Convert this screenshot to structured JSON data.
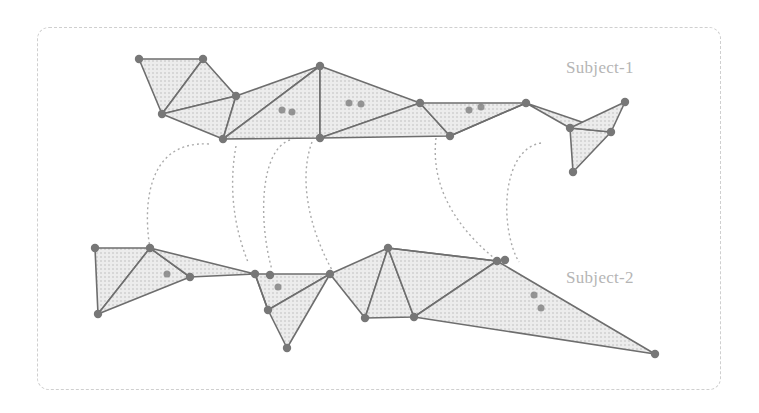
{
  "labels": {
    "subject1": "Subject-1",
    "subject2": "Subject-2"
  },
  "colors": {
    "edge": "#6e6e6e",
    "node": "#777777",
    "fill": "#d9d9d9",
    "connector": "#aaaaaa",
    "frame": "#cfcfcf",
    "label": "#b5b5b5"
  },
  "subject1": {
    "nodes": [
      [
        139,
        59
      ],
      [
        203,
        59
      ],
      [
        162,
        114
      ],
      [
        236,
        96
      ],
      [
        223,
        139
      ],
      [
        320,
        66
      ],
      [
        320,
        138
      ],
      [
        420,
        103
      ],
      [
        450,
        136
      ],
      [
        526,
        103
      ],
      [
        570,
        128
      ],
      [
        625,
        102
      ],
      [
        611,
        132
      ],
      [
        573,
        172
      ]
    ],
    "triangles": [
      [
        0,
        1,
        2
      ],
      [
        1,
        2,
        3
      ],
      [
        2,
        3,
        4
      ],
      [
        3,
        4,
        5
      ],
      [
        4,
        5,
        6
      ],
      [
        5,
        6,
        7
      ],
      [
        6,
        7,
        8
      ],
      [
        7,
        8,
        9
      ],
      [
        8,
        9,
        9
      ],
      [
        9,
        10,
        12
      ],
      [
        10,
        12,
        13
      ],
      [
        10,
        11,
        12
      ]
    ],
    "features": [
      [
        282,
        110
      ],
      [
        292,
        112
      ],
      [
        349,
        103
      ],
      [
        361,
        104
      ],
      [
        469,
        110
      ],
      [
        481,
        107
      ]
    ]
  },
  "subject2": {
    "nodes": [
      [
        95,
        248
      ],
      [
        150,
        248
      ],
      [
        190,
        277
      ],
      [
        98,
        314
      ],
      [
        255,
        274
      ],
      [
        270,
        275
      ],
      [
        330,
        274
      ],
      [
        268,
        310
      ],
      [
        287,
        348
      ],
      [
        365,
        318
      ],
      [
        388,
        248
      ],
      [
        414,
        317
      ],
      [
        497,
        261
      ],
      [
        505,
        260
      ],
      [
        655,
        354
      ]
    ],
    "triangles": [
      [
        0,
        1,
        3
      ],
      [
        1,
        2,
        3
      ],
      [
        1,
        2,
        4
      ],
      [
        4,
        6,
        7
      ],
      [
        6,
        7,
        8
      ],
      [
        4,
        7,
        7
      ],
      [
        6,
        9,
        10
      ],
      [
        9,
        10,
        11
      ],
      [
        10,
        11,
        12
      ],
      [
        11,
        12,
        14
      ],
      [
        10,
        12,
        12
      ]
    ],
    "features": [
      [
        167,
        274
      ],
      [
        278,
        287
      ],
      [
        534,
        295
      ],
      [
        541,
        308
      ]
    ]
  },
  "connectors": [
    {
      "from": [
        209,
        144
      ],
      "c1": [
        140,
        140
      ],
      "c2": [
        145,
        220
      ],
      "to": [
        150,
        248
      ]
    },
    {
      "from": [
        236,
        146
      ],
      "c1": [
        228,
        190
      ],
      "c2": [
        235,
        230
      ],
      "to": [
        248,
        262
      ]
    },
    {
      "from": [
        290,
        140
      ],
      "c1": [
        260,
        150
      ],
      "c2": [
        258,
        220
      ],
      "to": [
        272,
        270
      ]
    },
    {
      "from": [
        312,
        142
      ],
      "c1": [
        298,
        180
      ],
      "c2": [
        310,
        230
      ],
      "to": [
        332,
        270
      ]
    },
    {
      "from": [
        436,
        138
      ],
      "c1": [
        430,
        190
      ],
      "c2": [
        460,
        230
      ],
      "to": [
        494,
        258
      ]
    },
    {
      "from": [
        541,
        143
      ],
      "c1": [
        500,
        150
      ],
      "c2": [
        500,
        230
      ],
      "to": [
        519,
        262
      ]
    }
  ]
}
